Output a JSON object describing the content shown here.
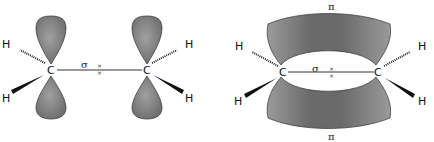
{
  "diagram": {
    "left_panel": {
      "description": "Ethylene sigma bond with unhybridized p orbitals",
      "atoms": {
        "carbon_left": "C",
        "carbon_right": "C",
        "hydrogen": "H"
      },
      "bond_label": "σ",
      "electron_marks": "×"
    },
    "right_panel": {
      "description": "Ethylene pi bond formed from overlapping p orbitals",
      "atoms": {
        "carbon_left": "C",
        "carbon_right": "C",
        "hydrogen": "H"
      },
      "bond_label": "σ",
      "pi_top_label": "π",
      "pi_bottom_label": "π",
      "electron_marks": "×"
    },
    "colors": {
      "orbital_fill": "#8a8a8a",
      "orbital_dark": "#5a5a5a",
      "stroke": "#222222"
    }
  }
}
